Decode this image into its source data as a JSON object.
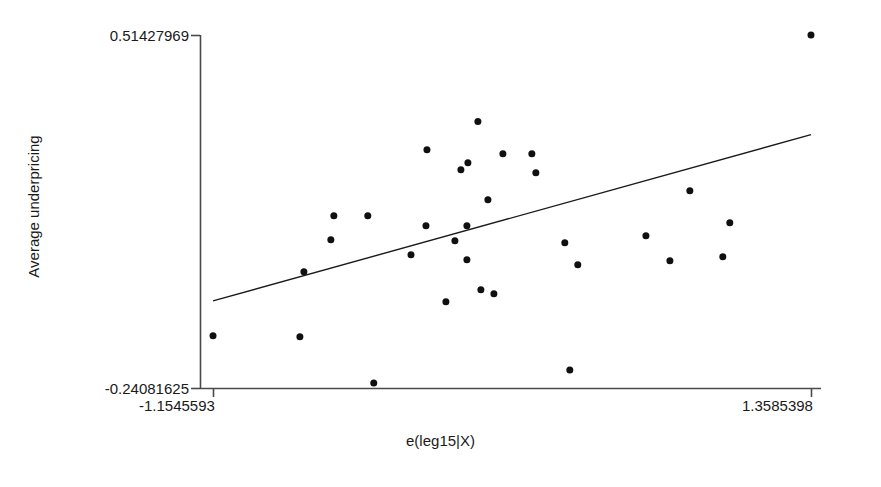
{
  "chart_data": {
    "type": "scatter",
    "title": "",
    "subtitle": "",
    "xlabel": "e(leg15|X)",
    "ylabel": "Average underpricing",
    "xlim": [
      -1.1545593,
      1.3585398
    ],
    "ylim": [
      -0.24081625,
      0.51427969
    ],
    "xticks": [
      -1.1545593,
      1.3585398
    ],
    "xtick_labels": [
      "-1.1545593",
      "1.3585398"
    ],
    "yticks": [
      -0.24081625,
      0.51427969
    ],
    "ytick_labels": [
      "-0.24081625",
      "0.51427969"
    ],
    "grid": false,
    "legend": null,
    "marker": {
      "shape": "circle",
      "color": "#101010",
      "size": 7
    },
    "points": [
      {
        "x": 1.3585,
        "y": 0.5143
      },
      {
        "x": -0.0414,
        "y": 0.3291
      },
      {
        "x": -0.2554,
        "y": 0.269
      },
      {
        "x": 0.0637,
        "y": 0.2604
      },
      {
        "x": 0.1854,
        "y": 0.2604
      },
      {
        "x": -0.0834,
        "y": 0.2412
      },
      {
        "x": -0.1128,
        "y": 0.2262
      },
      {
        "x": 0.2022,
        "y": 0.2198
      },
      {
        "x": 0.8494,
        "y": 0.1811
      },
      {
        "x": 0.0007,
        "y": 0.1618
      },
      {
        "x": -0.6467,
        "y": 0.1276
      },
      {
        "x": -0.5041,
        "y": 0.1276
      },
      {
        "x": 1.0173,
        "y": 0.1126
      },
      {
        "x": -0.0876,
        "y": 0.1062
      },
      {
        "x": -0.2596,
        "y": 0.1062
      },
      {
        "x": 0.6648,
        "y": 0.0848
      },
      {
        "x": -0.6593,
        "y": 0.0762
      },
      {
        "x": -0.138,
        "y": 0.0741
      },
      {
        "x": 0.3239,
        "y": 0.0698
      },
      {
        "x": -0.3225,
        "y": 0.0441
      },
      {
        "x": 0.9879,
        "y": 0.0398
      },
      {
        "x": 0.7655,
        "y": 0.0312
      },
      {
        "x": -0.0876,
        "y": 0.0334
      },
      {
        "x": 0.3784,
        "y": 0.0227
      },
      {
        "x": -0.7726,
        "y": 0.0077
      },
      {
        "x": -0.0288,
        "y": -0.0308
      },
      {
        "x": 0.0259,
        "y": -0.0394
      },
      {
        "x": -0.1758,
        "y": -0.0565
      },
      {
        "x": -1.1545,
        "y": -0.1293
      },
      {
        "x": -0.7894,
        "y": -0.1314
      },
      {
        "x": 0.3449,
        "y": -0.2023
      },
      {
        "x": -0.479,
        "y": -0.2301
      }
    ],
    "fit_line": {
      "type": "linear-fit",
      "x_start": -1.1545593,
      "y_start": -0.0545,
      "x_end": 1.3585398,
      "y_end": 0.3012,
      "color": "#1a1a1a",
      "width": 1.4
    },
    "axis_color": "#4a4a4a"
  },
  "axes": {
    "ylabel": "Average underpricing",
    "xlabel": "e(leg15|X)",
    "ytick_top": "0.51427969",
    "ytick_bottom": "-0.24081625",
    "xtick_left": "-1.1545593",
    "xtick_right": "1.3585398"
  }
}
